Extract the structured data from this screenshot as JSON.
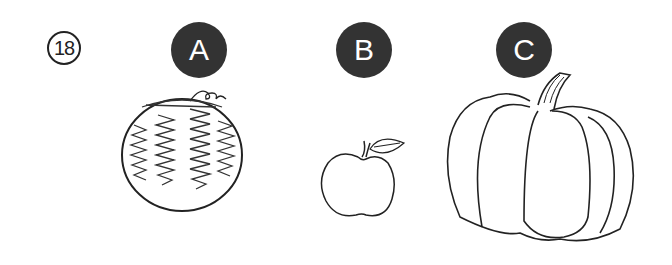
{
  "question": {
    "number": "18"
  },
  "options": [
    {
      "label": "A",
      "item": "watermelon"
    },
    {
      "label": "B",
      "item": "apple"
    },
    {
      "label": "C",
      "item": "pumpkin"
    }
  ],
  "colors": {
    "badge": "#333333",
    "line": "#222222",
    "background": "#ffffff"
  }
}
